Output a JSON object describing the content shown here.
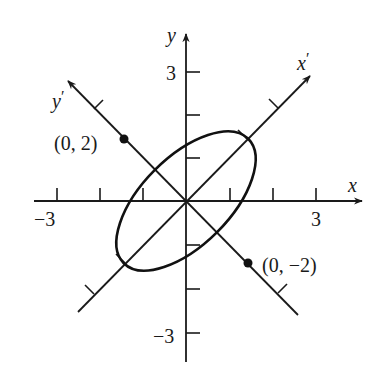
{
  "figure": {
    "axes": {
      "x_label": "x",
      "y_label": "y",
      "x_prime_label": "x",
      "x_prime_mark": "′",
      "y_prime_label": "y",
      "y_prime_mark": "′",
      "x_ticks": [
        -3,
        -2,
        -1,
        1,
        2,
        3
      ],
      "y_ticks": [
        -3,
        -2,
        -1,
        1,
        2,
        3
      ],
      "x_tick_labels": {
        "neg": "−3",
        "pos": "3"
      },
      "y_tick_labels": {
        "neg": "−3",
        "pos": "3"
      },
      "rotation_deg": 45
    },
    "ellipse": {
      "equation_rotated": "x'^2 + y'^2/4 = 1",
      "semi_axis_x_prime": 1,
      "semi_axis_y_prime": 2
    },
    "points": [
      {
        "label": "(0, 2)",
        "coords_rotated": [
          0,
          2
        ]
      },
      {
        "label": "(0, −2)",
        "coords_rotated": [
          0,
          -2
        ]
      }
    ],
    "colors": {
      "ink": "#1a1a1a",
      "background": "#ffffff"
    }
  }
}
